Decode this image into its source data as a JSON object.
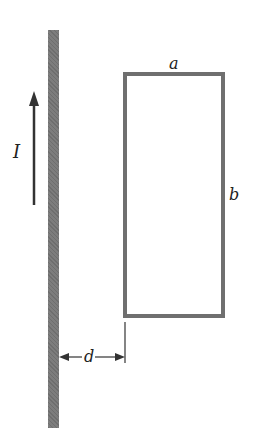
{
  "diagram": {
    "labels": {
      "current": "I",
      "width": "a",
      "height": "b",
      "distance": "d"
    },
    "colors": {
      "wire": "#7d7d7d",
      "loop": "#6f6f6f",
      "arrow": "#333333"
    }
  }
}
